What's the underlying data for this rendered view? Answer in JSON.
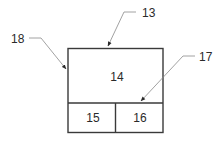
{
  "diagram": {
    "type": "block-diagram",
    "blocks": {
      "main": {
        "label": "14"
      },
      "bottom_left": {
        "label": "15"
      },
      "bottom_right": {
        "label": "16"
      }
    },
    "callouts": {
      "outer_box": {
        "label": "13"
      },
      "left_edge": {
        "label": "18"
      },
      "divider": {
        "label": "17"
      }
    },
    "colors": {
      "box_stroke": "#3a3a3a",
      "leader_stroke": "#8a8a8a",
      "text": "#2a2a2a",
      "background": "#ffffff"
    }
  }
}
